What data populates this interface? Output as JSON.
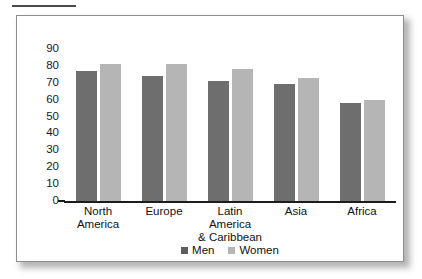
{
  "figure": {
    "rule_present": true
  },
  "legend": {
    "position": "bottom-center",
    "items": [
      {
        "label": "Men",
        "color": "#5e5e5e",
        "swatch": "men-swatch"
      },
      {
        "label": "Women",
        "color": "#b5b5b5",
        "swatch": "women-swatch"
      }
    ]
  },
  "chart_data": {
    "type": "bar",
    "title": "",
    "xlabel": "",
    "ylabel": "",
    "ylim": [
      0,
      90
    ],
    "yticks": [
      90,
      80,
      70,
      60,
      50,
      40,
      30,
      20,
      10,
      0
    ],
    "grid": false,
    "categories": [
      "North America",
      "Europe",
      "Latin America & Caribbean",
      "Asia",
      "Africa"
    ],
    "category_lines": [
      [
        "North",
        "America"
      ],
      [
        "Europe"
      ],
      [
        "Latin America",
        "& Caribbean"
      ],
      [
        "Asia"
      ],
      [
        "Africa"
      ]
    ],
    "series": [
      {
        "name": "Men",
        "color": "#6e6e6e",
        "values": [
          77,
          74,
          71,
          69,
          58
        ]
      },
      {
        "name": "Women",
        "color": "#b5b5b5",
        "values": [
          81,
          81,
          78,
          73,
          60
        ]
      }
    ]
  }
}
